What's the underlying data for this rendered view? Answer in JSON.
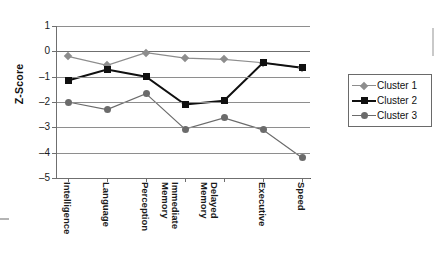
{
  "chart_data": {
    "type": "line",
    "title": "",
    "xlabel": "",
    "ylabel": "Z-Score",
    "ylim": [
      -5,
      1
    ],
    "yticks": [
      "1",
      "0",
      "-1",
      "-2",
      "-3",
      "-4",
      "-5"
    ],
    "grid": true,
    "legend_position": "right",
    "categories": [
      "Intelligence",
      "Language",
      "Perception",
      "Immediate\nMemory",
      "Delayed\nMemory",
      "Executive",
      "Speed"
    ],
    "series": [
      {
        "name": "Cluster 1",
        "color": "#8d8d8d",
        "marker": "diamond",
        "values": [
          -0.2,
          -0.55,
          -0.05,
          -0.27,
          -0.32,
          -0.45,
          -0.65
        ]
      },
      {
        "name": "Cluster 2",
        "color": "#101010",
        "marker": "square",
        "values": [
          -1.15,
          -0.72,
          -1.0,
          -2.1,
          -1.95,
          -0.45,
          -0.65
        ]
      },
      {
        "name": "Cluster 3",
        "color": "#6b6b6b",
        "marker": "circle",
        "values": [
          -2.0,
          -2.3,
          -1.67,
          -3.07,
          -2.63,
          -3.1,
          -4.2
        ]
      }
    ]
  },
  "legend": {
    "items": [
      {
        "label": "Cluster 1"
      },
      {
        "label": "Cluster 2"
      },
      {
        "label": "Cluster 3"
      }
    ]
  },
  "axis": {
    "y_title": "Z-Score"
  }
}
